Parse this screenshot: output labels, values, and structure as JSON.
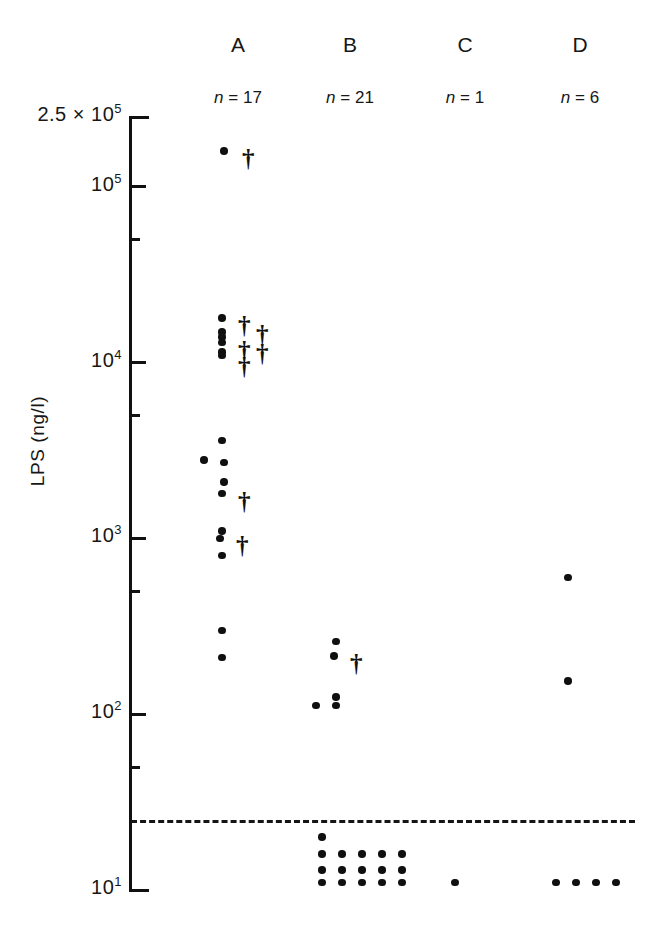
{
  "figure": {
    "y_axis_title": "LPS (ng/l)",
    "detection_limit_label": "",
    "columns": [
      {
        "id": "A",
        "label": "A",
        "n_label": "n = 17"
      },
      {
        "id": "B",
        "label": "B",
        "n_label": "n = 21"
      },
      {
        "id": "C",
        "label": "C",
        "n_label": "n = 1"
      },
      {
        "id": "D",
        "label": "D",
        "n_label": "n = 6"
      }
    ],
    "y_ticks": [
      {
        "label": "2.5 × 10",
        "exp": "5",
        "type": "major"
      },
      {
        "label": "10",
        "exp": "5",
        "type": "major"
      },
      {
        "label": "",
        "exp": "",
        "type": "minor"
      },
      {
        "label": "10",
        "exp": "4",
        "type": "major"
      },
      {
        "label": "",
        "exp": "",
        "type": "minor"
      },
      {
        "label": "10",
        "exp": "3",
        "type": "major"
      },
      {
        "label": "",
        "exp": "",
        "type": "minor"
      },
      {
        "label": "10",
        "exp": "2",
        "type": "major"
      },
      {
        "label": "",
        "exp": "",
        "type": "minor"
      },
      {
        "label": "10",
        "exp": "1",
        "type": "major"
      }
    ]
  },
  "chart_data": {
    "type": "scatter",
    "title": "",
    "xlabel": "",
    "ylabel": "LPS (ng/l)",
    "yscale": "log",
    "ylim": [
      10,
      250000
    ],
    "grid": false,
    "legend": null,
    "categories": [
      "A",
      "B",
      "C",
      "D"
    ],
    "counts": {
      "A": 17,
      "B": 21,
      "C": 1,
      "D": 6
    },
    "detection_limit": 25,
    "marker_types": {
      "dot": "survivor / sample value",
      "dagger": "non-survivor (died)"
    },
    "series": [
      {
        "name": "A",
        "n": 17,
        "points": [
          {
            "value": 160000,
            "marker": "dot"
          },
          {
            "value": 160000,
            "marker": "dagger"
          },
          {
            "value": 18000,
            "marker": "dot"
          },
          {
            "value": 18000,
            "marker": "dagger"
          },
          {
            "value": 16000,
            "marker": "dagger"
          },
          {
            "value": 15000,
            "marker": "dot"
          },
          {
            "value": 14000,
            "marker": "dot"
          },
          {
            "value": 13000,
            "marker": "dot"
          },
          {
            "value": 13000,
            "marker": "dagger"
          },
          {
            "value": 12500,
            "marker": "dagger"
          },
          {
            "value": 11500,
            "marker": "dot"
          },
          {
            "value": 11000,
            "marker": "dot"
          },
          {
            "value": 10500,
            "marker": "dagger"
          },
          {
            "value": 3600,
            "marker": "dot"
          },
          {
            "value": 2800,
            "marker": "dot"
          },
          {
            "value": 2700,
            "marker": "dot"
          },
          {
            "value": 2100,
            "marker": "dot"
          },
          {
            "value": 1800,
            "marker": "dot"
          },
          {
            "value": 1800,
            "marker": "dagger"
          },
          {
            "value": 1100,
            "marker": "dot"
          },
          {
            "value": 1000,
            "marker": "dot"
          },
          {
            "value": 1000,
            "marker": "dagger"
          },
          {
            "value": 800,
            "marker": "dot"
          },
          {
            "value": 300,
            "marker": "dot"
          },
          {
            "value": 210,
            "marker": "dot"
          }
        ]
      },
      {
        "name": "B",
        "n": 21,
        "points": [
          {
            "value": 260,
            "marker": "dot"
          },
          {
            "value": 215,
            "marker": "dot"
          },
          {
            "value": 215,
            "marker": "dagger"
          },
          {
            "value": 125,
            "marker": "dot"
          },
          {
            "value": 112,
            "marker": "dot"
          },
          {
            "value": 112,
            "marker": "dot"
          },
          {
            "value": 20,
            "marker": "dot"
          },
          {
            "value": 16,
            "marker": "dot"
          },
          {
            "value": 16,
            "marker": "dot"
          },
          {
            "value": 16,
            "marker": "dot"
          },
          {
            "value": 16,
            "marker": "dot"
          },
          {
            "value": 16,
            "marker": "dot"
          },
          {
            "value": 13,
            "marker": "dot"
          },
          {
            "value": 13,
            "marker": "dot"
          },
          {
            "value": 13,
            "marker": "dot"
          },
          {
            "value": 13,
            "marker": "dot"
          },
          {
            "value": 13,
            "marker": "dot"
          },
          {
            "value": 11,
            "marker": "dot"
          },
          {
            "value": 11,
            "marker": "dot"
          },
          {
            "value": 11,
            "marker": "dot"
          },
          {
            "value": 11,
            "marker": "dot"
          },
          {
            "value": 11,
            "marker": "dot"
          }
        ]
      },
      {
        "name": "C",
        "n": 1,
        "points": [
          {
            "value": 11,
            "marker": "dot"
          }
        ]
      },
      {
        "name": "D",
        "n": 6,
        "points": [
          {
            "value": 600,
            "marker": "dot"
          },
          {
            "value": 155,
            "marker": "dot"
          },
          {
            "value": 11,
            "marker": "dot"
          },
          {
            "value": 11,
            "marker": "dot"
          },
          {
            "value": 11,
            "marker": "dot"
          },
          {
            "value": 11,
            "marker": "dot"
          }
        ]
      }
    ]
  }
}
